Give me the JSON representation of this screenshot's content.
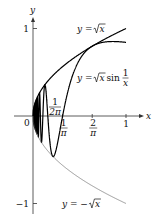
{
  "chart_data": {
    "type": "line",
    "title": "",
    "xlabel": "x",
    "ylabel": "y",
    "xlim": [
      0,
      1.15
    ],
    "ylim": [
      -1.05,
      1.1
    ],
    "grid": false,
    "x_ticks": [
      {
        "value": 0.31831,
        "label_num": "1",
        "label_den": "π"
      },
      {
        "value": 0.63662,
        "label_num": "2",
        "label_den": "π"
      },
      {
        "value": 1,
        "label": "1"
      }
    ],
    "y_ticks": [
      {
        "value": 1,
        "label": "1"
      },
      {
        "value": -1,
        "label": "−1"
      }
    ],
    "origin_label": "0",
    "series": [
      {
        "name": "y = √x",
        "function": "sqrt(x)",
        "domain": [
          0,
          1
        ],
        "color": "#000000",
        "style": "thick"
      },
      {
        "name": "y = √x sin(1/x)",
        "function": "sqrt(x)*sin(1/x)",
        "domain": [
          0.005,
          1
        ],
        "color": "#000000",
        "style": "thick"
      },
      {
        "name": "y = −√x",
        "function": "-sqrt(x)",
        "domain": [
          0,
          1
        ],
        "color": "#555555",
        "style": "thin"
      }
    ],
    "annotations": [
      {
        "text_num": "1",
        "text_den": "2π",
        "at_x": 0.159155,
        "note": "label near first positive crossing"
      }
    ],
    "legend_labels": {
      "sqrt": {
        "prefix": "y = ",
        "radical": "x"
      },
      "product": {
        "prefix": "y = ",
        "radical": "x",
        "suffix": " sin ",
        "frac_num": "1",
        "frac_den": "x"
      },
      "neg": {
        "prefix": "y = −",
        "radical": "x"
      }
    }
  }
}
